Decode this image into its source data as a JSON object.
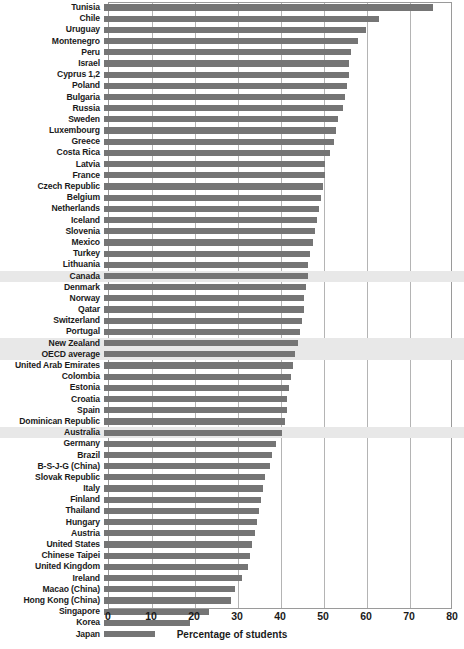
{
  "chart_data": {
    "type": "bar",
    "orientation": "horizontal",
    "title": "",
    "xlabel": "Percentage of students",
    "ylabel": "",
    "xlim": [
      0,
      80
    ],
    "xticks": [
      0,
      10,
      20,
      30,
      40,
      50,
      60,
      70,
      80
    ],
    "grid": true,
    "legend": null,
    "bar_color": "#757575",
    "highlight_color": "#e8e8e8",
    "highlighted_categories": [
      "Canada",
      "New Zealand",
      "OECD average",
      "Australia"
    ],
    "categories": [
      "Tunisia",
      "Chile",
      "Uruguay",
      "Montenegro",
      "Peru",
      "Israel",
      "Cyprus 1,2",
      "Poland",
      "Bulgaria",
      "Russia",
      "Sweden",
      "Luxembourg",
      "Greece",
      "Costa Rica",
      "Latvia",
      "France",
      "Czech Republic",
      "Belgium",
      "Netherlands",
      "Iceland",
      "Slovenia",
      "Mexico",
      "Turkey",
      "Lithuania",
      "Canada",
      "Denmark",
      "Norway",
      "Qatar",
      "Switzerland",
      "Portugal",
      "New Zealand",
      "OECD average",
      "United Arab Emirates",
      "Colombia",
      "Estonia",
      "Croatia",
      "Spain",
      "Dominican Republic",
      "Australia",
      "Germany",
      "Brazil",
      "B-S-J-G (China)",
      "Slovak Republic",
      "Italy",
      "Finland",
      "Thailand",
      "Hungary",
      "Austria",
      "United States",
      "Chinese Taipei",
      "United Kingdom",
      "Ireland",
      "Macao (China)",
      "Hong Kong (China)",
      "Singapore",
      "Korea",
      "Japan"
    ],
    "values": [
      76.5,
      64.0,
      61.0,
      59.0,
      57.5,
      57.0,
      57.0,
      56.5,
      56.0,
      55.5,
      54.5,
      54.0,
      53.5,
      52.5,
      51.5,
      51.5,
      51.0,
      50.5,
      50.0,
      49.5,
      49.0,
      48.5,
      48.0,
      47.5,
      47.5,
      47.0,
      46.5,
      46.5,
      46.0,
      45.5,
      45.0,
      44.5,
      44.0,
      43.5,
      43.0,
      42.5,
      42.5,
      42.0,
      41.5,
      40.0,
      39.0,
      38.5,
      37.5,
      37.0,
      36.5,
      36.0,
      35.5,
      35.0,
      34.5,
      34.0,
      33.5,
      32.0,
      30.5,
      29.5,
      24.5,
      20.0,
      11.8
    ]
  }
}
